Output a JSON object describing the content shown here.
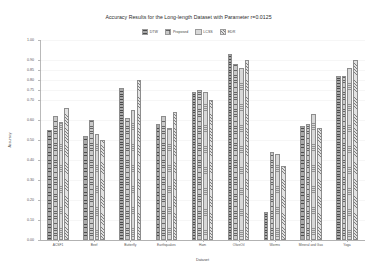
{
  "chart_data": {
    "type": "bar",
    "title": "Accuracy Results for the Long-length Dataset with Parameter r=0.0125",
    "xlabel": "Dataset",
    "ylabel": "Accuracy",
    "ylim": [
      0.0,
      1.0
    ],
    "yticks": [
      "0.00",
      "0.10",
      "0.20",
      "0.30",
      "0.40",
      "0.50",
      "0.60",
      "0.70",
      "0.75",
      "0.80",
      "0.85",
      "0.90",
      "1.00"
    ],
    "ytick_values": [
      0.0,
      0.1,
      0.2,
      0.3,
      0.4,
      0.5,
      0.6,
      0.7,
      0.75,
      0.8,
      0.85,
      0.9,
      1.0
    ],
    "grid": true,
    "legend_position": "top-center",
    "categories": [
      "ACSF1",
      "Beef",
      "Butterfly",
      "Earthquakes",
      "Ham",
      "OliveOil",
      "Worms",
      "Mineral and Gas",
      "Yoga"
    ],
    "series": [
      {
        "name": "DTW",
        "values": [
          0.55,
          0.52,
          0.76,
          0.58,
          0.74,
          0.93,
          0.14,
          0.57,
          0.82
        ]
      },
      {
        "name": "Proposed",
        "values": [
          0.62,
          0.6,
          0.61,
          0.62,
          0.75,
          0.88,
          0.44,
          0.58,
          0.82
        ]
      },
      {
        "name": "LCSS",
        "values": [
          0.59,
          0.53,
          0.65,
          0.56,
          0.74,
          0.86,
          0.43,
          0.63,
          0.86
        ]
      },
      {
        "name": "EDR",
        "values": [
          0.66,
          0.5,
          0.8,
          0.64,
          0.7,
          0.9,
          0.37,
          0.56,
          0.9
        ]
      }
    ]
  }
}
